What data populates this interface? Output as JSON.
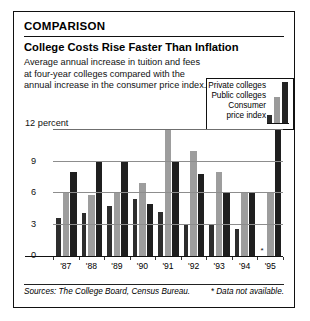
{
  "card": {
    "kicker": "COMPARISON",
    "headline": "College Costs Rise Faster Than Inflation",
    "deck_line1": "Average annual increase in tuition and fees",
    "deck_line2": "at four-year colleges compared with the",
    "deck_line3": "annual increase in the consumer price index."
  },
  "legend": {
    "private_label": "Private colleges",
    "public_label": "Public colleges",
    "cpi_label_line1": "Consumer",
    "cpi_label_line2": "price index"
  },
  "footer": {
    "sources": "Sources: The College Board, Census Bureau.",
    "note": "* Data not available."
  },
  "chart_data": {
    "type": "bar",
    "title": "College Costs Rise Faster Than Inflation",
    "subtitle": "Average annual increase in tuition and fees at four-year colleges compared with the annual increase in the consumer price index.",
    "xlabel": "",
    "ylabel": "percent",
    "ylim": [
      0,
      12
    ],
    "yticks": [
      0,
      3,
      6,
      9,
      12
    ],
    "ytick_labels": [
      "0",
      "3",
      "6",
      "9",
      "12 percent"
    ],
    "grid": true,
    "legend_position": "top-right",
    "categories": [
      "'87",
      "'88",
      "'89",
      "'90",
      "'91",
      "'92",
      "'93",
      "'94",
      "'95"
    ],
    "series": [
      {
        "name": "Consumer price index",
        "color": "#2d2d2d",
        "values": [
          3.6,
          4.1,
          4.8,
          5.4,
          4.2,
          3.0,
          3.0,
          2.6,
          null
        ]
      },
      {
        "name": "Public colleges",
        "color": "#9d9d9d",
        "values": [
          6.0,
          5.8,
          6.0,
          7.0,
          12.0,
          10.0,
          8.0,
          6.0,
          6.0
        ]
      },
      {
        "name": "Private colleges",
        "color": "#1f1f1f",
        "values": [
          8.0,
          9.0,
          9.0,
          5.0,
          9.0,
          7.8,
          6.0,
          6.0,
          12.0
        ]
      }
    ],
    "annotations": [
      {
        "text": "*",
        "category": "'95",
        "series": "Consumer price index",
        "meaning": "Data not available."
      }
    ]
  }
}
